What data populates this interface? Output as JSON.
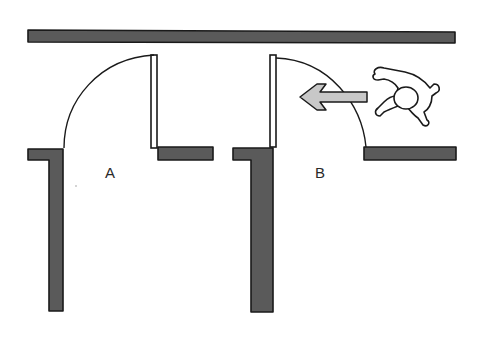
{
  "diagram": {
    "type": "door-swing-plan",
    "labels": {
      "door_a": "A",
      "door_b": "B"
    },
    "colors": {
      "wall_fill": "#5a5a5a",
      "wall_outline": "#1a1a1a",
      "arrow_fill": "#c8c8c8",
      "background": "#ffffff"
    },
    "elements": [
      {
        "id": "corridor-wall-top",
        "kind": "wall"
      },
      {
        "id": "door-a",
        "kind": "door",
        "label": "A",
        "swing": "into room (away from corridor)"
      },
      {
        "id": "door-b",
        "kind": "door",
        "label": "B",
        "swing": "into corridor"
      },
      {
        "id": "movement-arrow",
        "kind": "arrow",
        "direction": "left"
      },
      {
        "id": "person",
        "kind": "person-top-view"
      }
    ]
  }
}
